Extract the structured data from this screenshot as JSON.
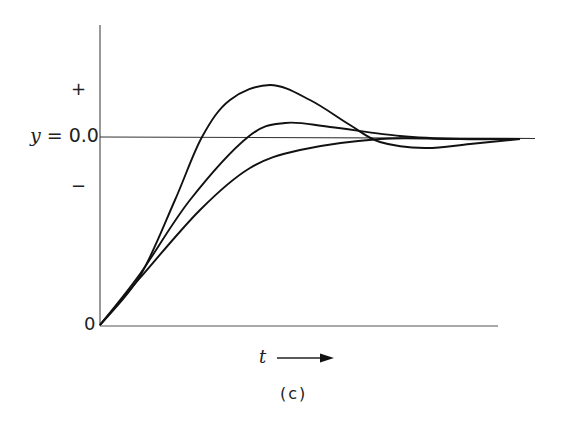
{
  "chart_data": {
    "type": "line",
    "title": "",
    "caption": "(c)",
    "xlabel": "t",
    "xlabel_arrow": "→",
    "ylabel": "y = 0.0",
    "y_reference_label": "y = 0.0",
    "y_tick_labels": [
      "+",
      "y = 0.0",
      "−",
      "0"
    ],
    "origin_label": "0",
    "grid": false,
    "legend": null,
    "series": [
      {
        "name": "large-overshoot",
        "points_px": [
          [
            100,
            325
          ],
          [
            140,
            276
          ],
          [
            175,
            200
          ],
          [
            202,
            137
          ],
          [
            230,
            100
          ],
          [
            270,
            85
          ],
          [
            310,
            100
          ],
          [
            350,
            125
          ],
          [
            380,
            142
          ],
          [
            425,
            148
          ],
          [
            470,
            144
          ],
          [
            520,
            139
          ]
        ]
      },
      {
        "name": "small-overshoot",
        "points_px": [
          [
            100,
            325
          ],
          [
            140,
            274
          ],
          [
            190,
            200
          ],
          [
            248,
            137
          ],
          [
            285,
            123
          ],
          [
            330,
            127
          ],
          [
            400,
            136
          ],
          [
            460,
            139
          ],
          [
            520,
            139
          ]
        ]
      },
      {
        "name": "overdamped",
        "points_px": [
          [
            100,
            325
          ],
          [
            140,
            278
          ],
          [
            200,
            210
          ],
          [
            250,
            168
          ],
          [
            300,
            150
          ],
          [
            380,
            139
          ],
          [
            450,
            139
          ],
          [
            520,
            139
          ]
        ]
      }
    ],
    "axes_px": {
      "origin": [
        100,
        325
      ],
      "y_axis_top": 25,
      "x_axis_right": 498,
      "reference_line": {
        "y": 137,
        "x_start": 100,
        "x_end": 535
      }
    }
  },
  "labels": {
    "plus": "+",
    "minus": "−",
    "zero": "0",
    "y_var": "y",
    "y_eq": " = 0.0",
    "t": "t",
    "caption": "(c)"
  }
}
